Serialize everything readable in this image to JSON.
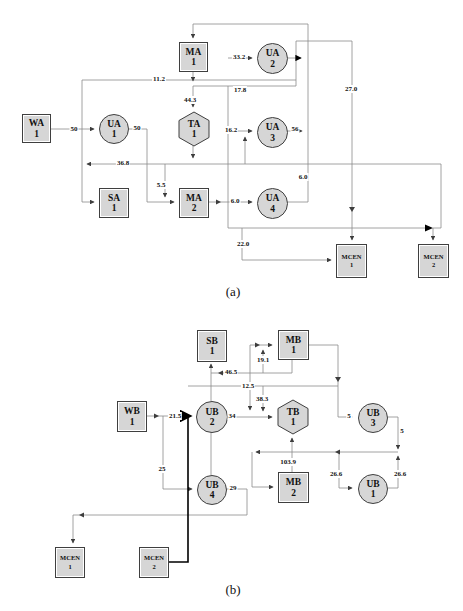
{
  "figure": {
    "captions": {
      "a": "(a)",
      "b": "(b)"
    },
    "colors": {
      "node_fill": "#d6d6d6",
      "node_border": "#3f3f3f",
      "line": "#8a8a8a",
      "arrow": "#3d3d3d",
      "bold_line": "#000000",
      "background": "#ffffff"
    }
  },
  "panel_a": {
    "nodes": {
      "wa1": {
        "line1": "WA",
        "line2": "1",
        "shape": "square"
      },
      "ua1": {
        "line1": "UA",
        "line2": "1",
        "shape": "circle"
      },
      "sa1": {
        "line1": "SA",
        "line2": "1",
        "shape": "square"
      },
      "ma1": {
        "line1": "MA",
        "line2": "1",
        "shape": "square"
      },
      "ta1": {
        "line1": "TA",
        "line2": "1",
        "shape": "hexagon"
      },
      "ma2": {
        "line1": "MA",
        "line2": "2",
        "shape": "square"
      },
      "ua2": {
        "line1": "UA",
        "line2": "2",
        "shape": "circle"
      },
      "ua3": {
        "line1": "UA",
        "line2": "3",
        "shape": "circle"
      },
      "ua4": {
        "line1": "UA",
        "line2": "4",
        "shape": "circle"
      },
      "mcen1": {
        "line1": "MCEN",
        "line2": "1",
        "shape": "square"
      },
      "mcen2": {
        "line1": "MCEN",
        "line2": "2",
        "shape": "square"
      }
    },
    "flows": {
      "wa1_to_ua1": "50",
      "ua1_out": "50",
      "feedback_top": "11.2",
      "to_ua2": "33.2",
      "ma1_branch": "17.8",
      "to_ta1": "44.3",
      "to_ua3": "16.2",
      "ua3_out": "56",
      "return_main": "36.8",
      "to_ma2": "5.5",
      "ma2_to_ua4": "6.0",
      "ua4_out": "6.0",
      "to_mcen1_top": "27.0",
      "to_mcen1_left": "22.0"
    }
  },
  "panel_b": {
    "nodes": {
      "sb1": {
        "line1": "SB",
        "line2": "1",
        "shape": "square"
      },
      "mb1": {
        "line1": "MB",
        "line2": "1",
        "shape": "square"
      },
      "wb1": {
        "line1": "WB",
        "line2": "1",
        "shape": "square"
      },
      "ub2": {
        "line1": "UB",
        "line2": "2",
        "shape": "circle"
      },
      "tb1": {
        "line1": "TB",
        "line2": "1",
        "shape": "hexagon"
      },
      "ub3": {
        "line1": "UB",
        "line2": "3",
        "shape": "circle"
      },
      "ub4": {
        "line1": "UB",
        "line2": "4",
        "shape": "circle"
      },
      "mb2": {
        "line1": "MB",
        "line2": "2",
        "shape": "square"
      },
      "ub1": {
        "line1": "UB",
        "line2": "1",
        "shape": "circle"
      },
      "mcen1": {
        "line1": "MCEN",
        "line2": "1",
        "shape": "square"
      },
      "mcen2": {
        "line1": "MCEN",
        "line2": "2",
        "shape": "square"
      }
    },
    "flows": {
      "to_mb1": "19.1",
      "to_sb1": "46.5",
      "cross_line": "12.5",
      "to_tb1_top": "38.3",
      "wb1_to_ub2": "21.5",
      "ub2_to_tb1": "34",
      "to_ub4": "25",
      "ub4_out": "29",
      "to_ub3": "5",
      "ub3_out": "5",
      "mb2_to_tb1": "103.9",
      "to_ub1": "26.6",
      "ub1_out": "26.6"
    }
  }
}
